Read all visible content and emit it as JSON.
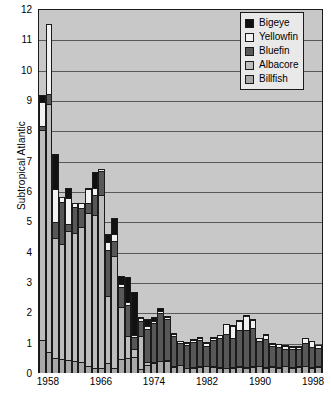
{
  "chart_data": {
    "type": "bar",
    "subtype": "stacked-bar",
    "title": "",
    "xlabel": "",
    "ylabel": "Subtropical Atlantic",
    "ylim": [
      0,
      12
    ],
    "ytick_step": 1,
    "yticks": [
      0,
      1,
      2,
      3,
      4,
      5,
      6,
      7,
      8,
      9,
      10,
      11,
      12
    ],
    "xticks": [
      "1958",
      "1966",
      "1974",
      "1982",
      "1990",
      "1998"
    ],
    "xtick_years": [
      1958,
      1966,
      1974,
      1982,
      1990,
      1998
    ],
    "grid": "horizontal",
    "legend_position": "top-right",
    "note": "Topmost bar (1957) is clipped by the 12 axis maximum.",
    "categories": [
      1957,
      1958,
      1959,
      1960,
      1961,
      1962,
      1963,
      1964,
      1965,
      1966,
      1967,
      1968,
      1969,
      1970,
      1971,
      1972,
      1973,
      1974,
      1975,
      1976,
      1977,
      1978,
      1979,
      1980,
      1981,
      1982,
      1983,
      1984,
      1985,
      1986,
      1987,
      1988,
      1989,
      1990,
      1991,
      1992,
      1993,
      1994,
      1995,
      1996,
      1997,
      1998,
      1999
    ],
    "series": [
      {
        "name": "Billfish",
        "color": "#a8a8a8",
        "values": [
          1.1,
          0.7,
          0.5,
          0.45,
          0.42,
          0.4,
          0.35,
          0.22,
          0.15,
          0.16,
          0.33,
          0.18,
          0.45,
          0.5,
          0.52,
          0.12,
          0.28,
          0.33,
          0.38,
          0.4,
          0.2,
          0.25,
          0.15,
          0.18,
          0.2,
          0.22,
          0.2,
          0.18,
          0.15,
          0.18,
          0.2,
          0.18,
          0.2,
          0.22,
          0.18,
          0.2,
          0.18,
          0.22,
          0.18,
          0.2,
          0.22,
          0.18,
          0.2
        ]
      },
      {
        "name": "Albacore",
        "color": "#bdbdbd",
        "values": [
          6.95,
          8.2,
          4.0,
          3.85,
          4.3,
          4.25,
          4.5,
          5.1,
          5.1,
          5.75,
          2.25,
          3.7,
          1.75,
          0.75,
          0.32,
          1.15,
          0.1,
          0.08,
          0.06,
          0.06,
          0.05,
          0.05,
          0.05,
          0.05,
          0.05,
          0.05,
          0.05,
          0.05,
          0.05,
          0.05,
          0.05,
          0.05,
          0.05,
          0.05,
          0.05,
          0.05,
          0.05,
          0.05,
          0.05,
          0.05,
          0.05,
          0.05,
          0.05
        ]
      },
      {
        "name": "Bluefin",
        "color": "#585858",
        "values": [
          0.15,
          0.35,
          0.55,
          1.4,
          0.25,
          0.9,
          0.65,
          0.35,
          0.7,
          0.8,
          1.55,
          0.55,
          0.7,
          1.05,
          0.42,
          0.5,
          1.15,
          1.3,
          1.6,
          1.4,
          1.05,
          0.75,
          0.8,
          0.85,
          0.9,
          0.7,
          0.9,
          1.0,
          1.15,
          1.0,
          1.25,
          1.25,
          1.3,
          0.85,
          0.95,
          0.7,
          0.7,
          0.6,
          0.62,
          0.6,
          0.8,
          0.7,
          0.65
        ]
      },
      {
        "name": "Yellowfin",
        "color": "#f2f2f2",
        "values": [
          0.85,
          2.35,
          1.1,
          0.2,
          0.9,
          0.15,
          0.2,
          0.5,
          0.25,
          0.12,
          0.3,
          0.25,
          0.12,
          0.15,
          0.1,
          0.15,
          0.12,
          0.12,
          0.12,
          0.1,
          0.1,
          0.1,
          0.1,
          0.12,
          0.12,
          0.12,
          0.12,
          0.12,
          0.35,
          0.42,
          0.32,
          0.5,
          0.3,
          0.12,
          0.18,
          0.12,
          0.12,
          0.12,
          0.12,
          0.12,
          0.18,
          0.22,
          0.12
        ]
      },
      {
        "name": "Bigeye",
        "color": "#111111",
        "values": [
          0.25,
          0.05,
          1.2,
          0.0,
          0.35,
          0.0,
          0.0,
          0.05,
          0.55,
          0.0,
          0.3,
          0.55,
          0.3,
          0.85,
          1.45,
          0.05,
          0.25,
          0.15,
          0.12,
          0.05,
          0.05,
          0.05,
          0.05,
          0.05,
          0.05,
          0.05,
          0.05,
          0.05,
          0.05,
          0.05,
          0.05,
          0.05,
          0.05,
          0.05,
          0.05,
          0.05,
          0.05,
          0.05,
          0.05,
          0.05,
          0.05,
          0.05,
          0.05
        ]
      }
    ],
    "legend": [
      {
        "label": "Bigeye",
        "color": "#111111"
      },
      {
        "label": "Yellowfin",
        "color": "#f2f2f2"
      },
      {
        "label": "Bluefin",
        "color": "#585858"
      },
      {
        "label": "Albacore",
        "color": "#bdbdbd"
      },
      {
        "label": "Billfish",
        "color": "#a8a8a8"
      }
    ]
  },
  "colors": {
    "plot_background": "#c8c8c8",
    "gridline": "#555a5a",
    "axis": "#1a1a1a",
    "legend_background": "#e9e9e9",
    "page_background": "#ffffff"
  }
}
